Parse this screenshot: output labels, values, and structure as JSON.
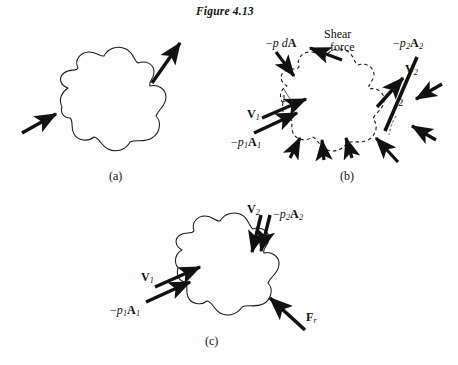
{
  "figure": {
    "title": "Figure 4.13",
    "background_color": "#fdfdfd",
    "ink_color": "#111111"
  },
  "panels": [
    {
      "id": "a",
      "label": "(a)",
      "outline_style": "solid",
      "description": "Control volume blob with one inflow arrow at lower left and one outflow arrow at upper right",
      "labels": []
    },
    {
      "id": "b",
      "label": "(b)",
      "outline_style": "dashed",
      "description": "Free-body diagram of the control volume showing distributed pressure forces, shear force, and section flow vectors",
      "labels": [
        {
          "name": "pressure-differential",
          "html": "−<i>p d</i><b>A</b>"
        },
        {
          "name": "shear-force-line1",
          "html": "Shear"
        },
        {
          "name": "shear-force-line2",
          "html": "force"
        },
        {
          "name": "pressure-force-2",
          "html": "−<i>p</i><sub>2</sub><b>A</b><sub>2</sub>"
        },
        {
          "name": "velocity-2",
          "html": "<b>V</b><sub>2</sub>"
        },
        {
          "name": "section-2",
          "html": "2"
        },
        {
          "name": "velocity-1",
          "html": "<b>V</b><sub>1</sub>"
        },
        {
          "name": "section-1",
          "html": "1"
        },
        {
          "name": "pressure-force-1",
          "html": "−<i>p</i><sub>1</sub><b>A</b><sub>1</sub>"
        }
      ]
    },
    {
      "id": "c",
      "label": "(c)",
      "outline_style": "solid",
      "description": "Control volume with resultant force vector replacing the distributed pressure and shear forces",
      "labels": [
        {
          "name": "velocity-2",
          "html": "<b>V</b><sub>2</sub>"
        },
        {
          "name": "pressure-force-2",
          "html": "−<i>p</i><sub>2</sub><b>A</b><sub>2</sub>"
        },
        {
          "name": "velocity-1",
          "html": "<b>V</b><sub>1</sub>"
        },
        {
          "name": "pressure-force-1",
          "html": "−<i>p</i><sub>1</sub><b>A</b><sub>1</sub>"
        },
        {
          "name": "resultant-force",
          "html": "<b>F</b><sub>r</sub>"
        }
      ]
    }
  ]
}
